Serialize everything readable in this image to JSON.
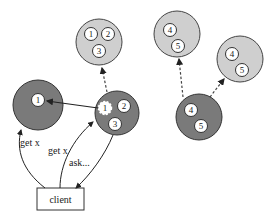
{
  "diagram": {
    "colors": {
      "dark_group": "#7a7a7a",
      "light_group": "#cfcfcf",
      "node_fill": "#ffffff",
      "stroke": "#333333"
    },
    "client": {
      "label": "client"
    },
    "groups": [
      {
        "id": "left-dark",
        "style": "dark",
        "nodes": [
          "1"
        ]
      },
      {
        "id": "center-dark",
        "style": "dark",
        "nodes": [
          "1",
          "2",
          "3"
        ],
        "note": "node 1 highlighted (dashed)"
      },
      {
        "id": "top-left-light",
        "style": "light",
        "nodes": [
          "1",
          "2",
          "3"
        ]
      },
      {
        "id": "top-mid-light",
        "style": "light",
        "nodes": [
          "4",
          "5"
        ]
      },
      {
        "id": "right-dark",
        "style": "dark",
        "nodes": [
          "4",
          "5"
        ]
      },
      {
        "id": "right-light",
        "style": "light",
        "nodes": [
          "4",
          "5"
        ]
      }
    ],
    "edges": [
      {
        "from": "client",
        "to": "left-dark",
        "label": "get x",
        "style": "solid"
      },
      {
        "from": "client",
        "to": "center-dark",
        "label": "get x",
        "style": "solid"
      },
      {
        "from": "center-dark",
        "to": "client",
        "label": "ask...",
        "style": "solid"
      },
      {
        "from": "center-dark.1",
        "to": "left-dark.1",
        "label": "",
        "style": "solid"
      },
      {
        "from": "center-dark",
        "to": "top-left-light",
        "label": "",
        "style": "dashed"
      },
      {
        "from": "right-dark",
        "to": "top-mid-light",
        "label": "",
        "style": "dashed"
      },
      {
        "from": "right-dark",
        "to": "right-light",
        "label": "",
        "style": "dashed"
      }
    ],
    "labels": {
      "edge_get_x_left": "get x",
      "edge_get_x_center": "get x",
      "edge_ask": "ask...",
      "n1": "1",
      "n2": "2",
      "n3": "3",
      "n4": "4",
      "n5": "5"
    }
  }
}
